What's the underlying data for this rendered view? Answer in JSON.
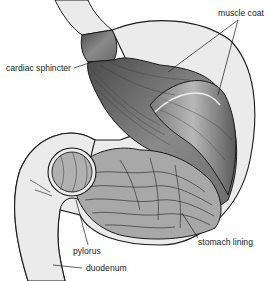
{
  "figure": {
    "labels": [
      {
        "id": "muscle-coat",
        "text": "muscle coat"
      },
      {
        "id": "cardiac-sphincter",
        "text": "cardiac sphincter"
      },
      {
        "id": "pylorus",
        "text": "pylorus"
      },
      {
        "id": "stomach-lining",
        "text": "stomach lining"
      },
      {
        "id": "duodenum",
        "text": "duodenum"
      }
    ],
    "colors": {
      "outline": "#1a1a1a",
      "outer_wall": "#ebebeb",
      "muscle": "#9a9a9a",
      "muscle_dark": "#5a5a5a",
      "lining": "#a8a8a8",
      "pylorus_ring": "#b0b0b0"
    }
  }
}
